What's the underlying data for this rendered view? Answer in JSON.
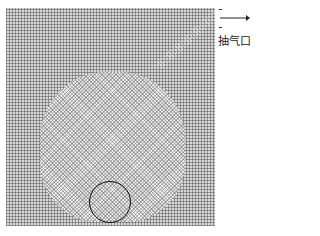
{
  "diagram": {
    "type": "computational-mesh",
    "label": "抽气口",
    "outlet_arrow": "right-arrow",
    "features": [
      "structured-background-grid",
      "refined-central-region",
      "circular-boundary"
    ]
  }
}
